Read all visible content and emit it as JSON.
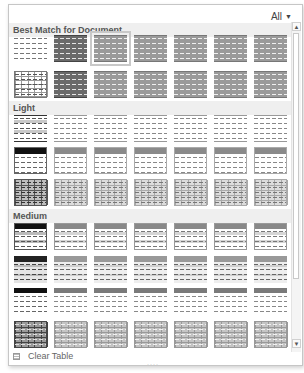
{
  "filter": {
    "label": "All",
    "caret": "▼"
  },
  "sections": [
    {
      "id": "best-match",
      "title": "Best Match for Document",
      "top": 1
    },
    {
      "id": "light",
      "title": "Light",
      "top": 79
    },
    {
      "id": "medium",
      "title": "Medium",
      "top": 187
    }
  ],
  "rows": [
    {
      "section": "best-match",
      "top": 13,
      "styles": [
        "plain",
        "dark-banded",
        "mid-banded-selected",
        "mid-banded",
        "mid-banded",
        "mid-banded",
        "mid-banded"
      ]
    },
    {
      "section": "best-match",
      "top": 49,
      "styles": [
        "grid",
        "dark-banded",
        "mid-banded",
        "mid-banded",
        "mid-banded",
        "mid-banded",
        "mid-banded"
      ]
    },
    {
      "section": "light",
      "top": 93,
      "styles": [
        "light-banded-dark",
        "light-banded",
        "light-banded",
        "light-banded",
        "light-banded",
        "light-banded",
        "light-banded"
      ]
    },
    {
      "section": "light",
      "top": 125,
      "styles": [
        "light-header-black",
        "light-header",
        "light-header",
        "light-header",
        "light-header",
        "light-header",
        "light-header"
      ]
    },
    {
      "section": "light",
      "top": 157,
      "styles": [
        "light-grid-dark",
        "light-grid",
        "light-grid",
        "light-grid",
        "light-grid",
        "light-grid",
        "light-grid"
      ]
    },
    {
      "section": "medium",
      "top": 201,
      "styles": [
        "medium-black",
        "medium-gray",
        "medium-gray",
        "medium-gray",
        "medium-gray",
        "medium-gray",
        "medium-gray"
      ]
    },
    {
      "section": "medium",
      "top": 234,
      "styles": [
        "medium-cols-black",
        "medium-cols",
        "medium-cols",
        "medium-cols",
        "medium-cols",
        "medium-cols",
        "medium-cols"
      ]
    },
    {
      "section": "medium",
      "top": 266,
      "styles": [
        "medium-header-black",
        "medium-header",
        "medium-header",
        "medium-header",
        "medium-header",
        "medium-header",
        "medium-header"
      ]
    },
    {
      "section": "medium",
      "top": 299,
      "styles": [
        "medium-grid-dark",
        "medium-grid",
        "medium-grid",
        "medium-grid",
        "medium-grid",
        "medium-grid",
        "medium-grid"
      ]
    }
  ],
  "scrollbar": {
    "up": "▲",
    "down": "▼"
  },
  "footer": {
    "clear_label": "Clear Table",
    "clear_mnemonic": "C",
    "grip": "····"
  },
  "colors": {
    "dark": "#5a5a5a",
    "mid": "#8c8c8c",
    "light": "#bdbdbd",
    "black": "#1a1a1a"
  }
}
